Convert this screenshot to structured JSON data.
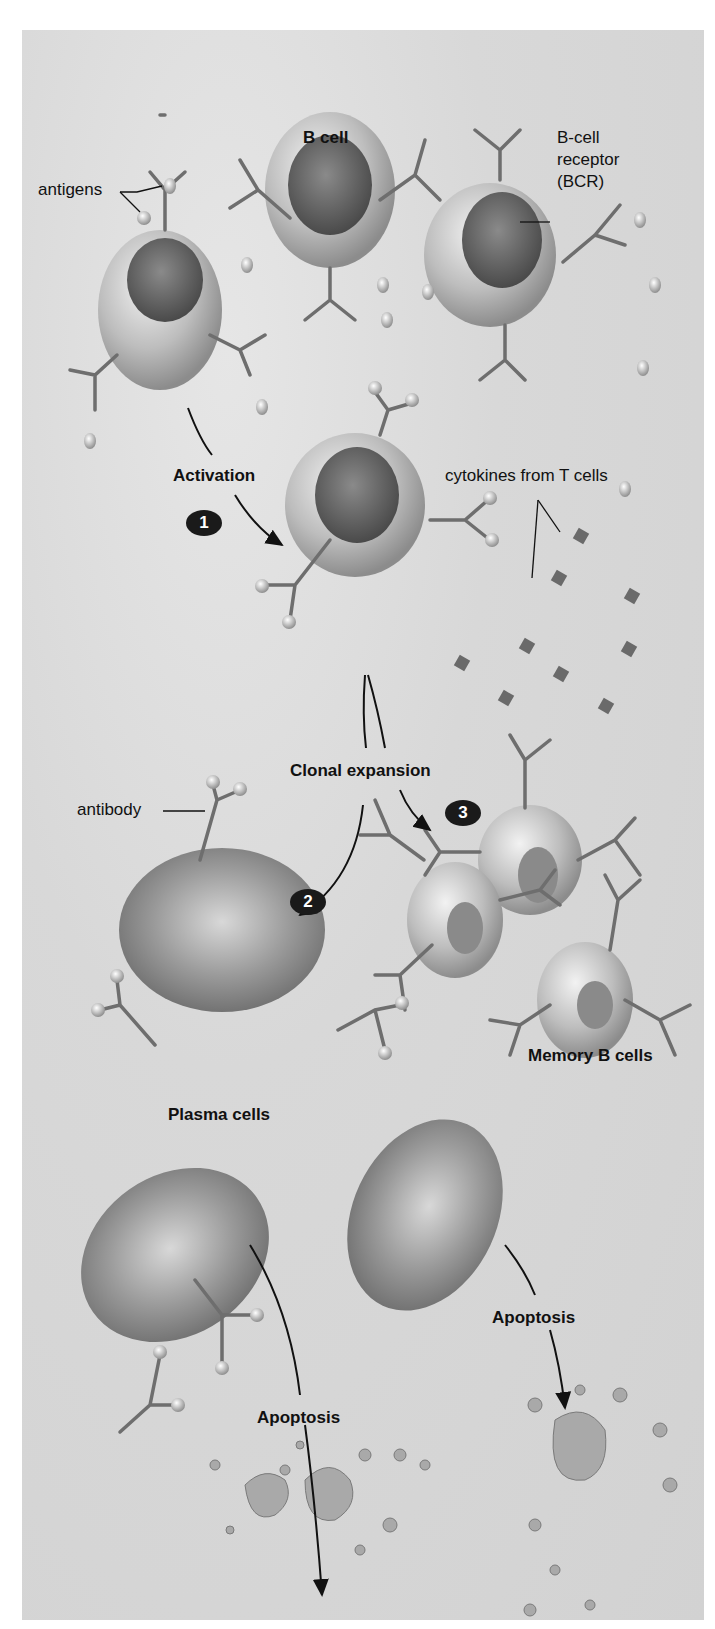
{
  "diagram": {
    "labels": {
      "b_cell": "B cell",
      "antigens": "antigens",
      "bcr_line1": "B-cell",
      "bcr_line2": "receptor",
      "bcr_line3": "(BCR)",
      "activation": "Activation",
      "cytokines": "cytokines from T cells",
      "clonal_expansion": "Clonal expansion",
      "antibody": "antibody",
      "memory_b_cells": "Memory B cells",
      "plasma_cells": "Plasma cells",
      "apoptosis_left": "Apoptosis",
      "apoptosis_right": "Apoptosis"
    },
    "steps": [
      {
        "number": "1",
        "label": "Activation"
      },
      {
        "number": "2",
        "label": "Differentiation to plasma cells"
      },
      {
        "number": "3",
        "label": "Differentiation to memory B cells"
      }
    ],
    "colors": {
      "background": "#dcdcdc",
      "badge": "#1a1a1a",
      "text": "#111111",
      "cell": "#b5b5b5",
      "receptor": "#6e6e6e"
    }
  }
}
